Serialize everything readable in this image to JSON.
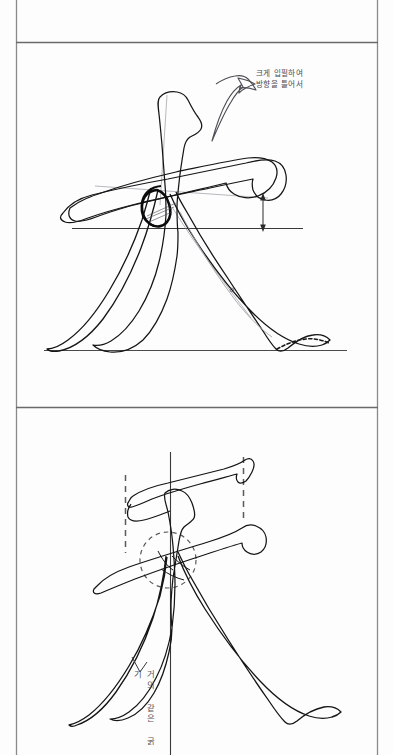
{
  "page": {
    "background_color": "#fdfdfd",
    "ink_color": "#151515",
    "guide_color": "#6d6d6d",
    "annotation_color": "#4a4a52",
    "width": 393,
    "height": 755
  },
  "panels": [
    {
      "id": "panel-top",
      "name": "upper-stroke-diagram",
      "frame": {
        "x": 16,
        "y": 42,
        "width": 362,
        "height": 324
      },
      "character": "夫",
      "annotation": {
        "lines": [
          "크게 입필하여",
          "방향을 틀어서"
        ],
        "position": {
          "x": 256,
          "y": 69
        }
      },
      "markers": [
        {
          "type": "curved-arrow",
          "name": "direction-arrow",
          "label": ""
        },
        {
          "type": "dimension-arrow",
          "name": "height-dimension-arrow",
          "label": ""
        },
        {
          "type": "baseline",
          "name": "upper-baseline",
          "label": ""
        },
        {
          "type": "baseline",
          "name": "lower-baseline",
          "label": ""
        },
        {
          "type": "ink-knot",
          "name": "stroke-intersection-knot",
          "label": ""
        },
        {
          "type": "center-mark",
          "name": "center-dot-marker",
          "label": "o"
        }
      ]
    },
    {
      "id": "panel-bottom",
      "name": "lower-stroke-diagram",
      "frame": {
        "x": 16,
        "y": 407,
        "width": 362,
        "height": 348
      },
      "character": "夫",
      "annotation": {
        "lines": [
          "거의 같은 굵기"
        ],
        "position": {
          "x": 136,
          "y": 670
        },
        "orientation": "vertical"
      },
      "markers": [
        {
          "type": "dashed-vertical-guide",
          "name": "left-dashed-guide",
          "label": ""
        },
        {
          "type": "dashed-vertical-guide",
          "name": "right-dashed-guide",
          "label": ""
        },
        {
          "type": "dashed-circle",
          "name": "intersection-focus-circle",
          "label": ""
        },
        {
          "type": "center-axis",
          "name": "vertical-center-axis",
          "label": ""
        },
        {
          "type": "leader-line",
          "name": "thickness-leader-line",
          "label": ""
        }
      ]
    }
  ]
}
